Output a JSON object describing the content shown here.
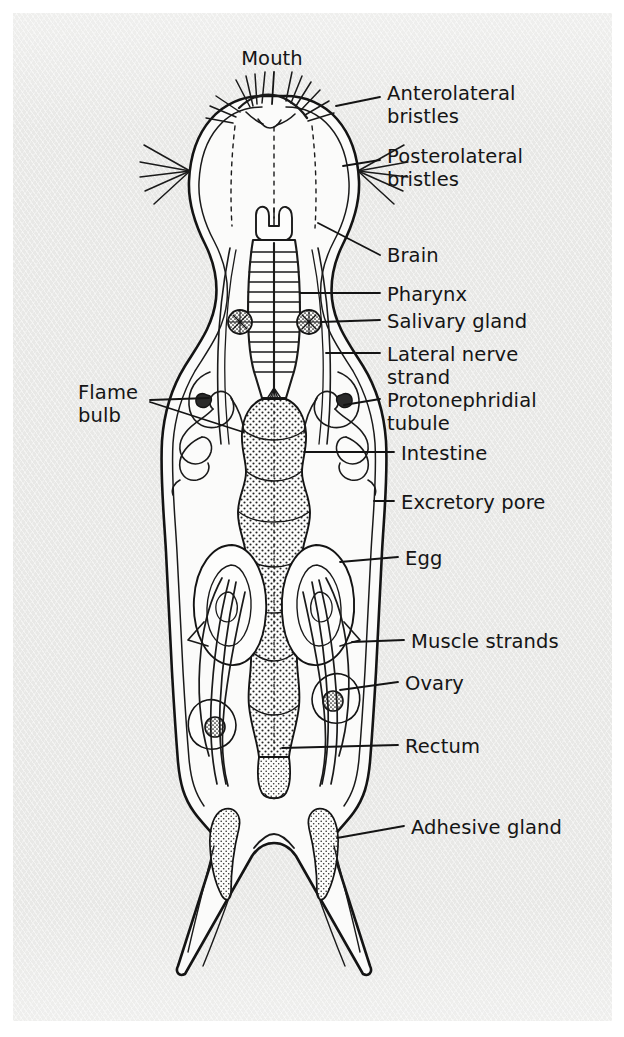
{
  "figure": {
    "organism_outline_color": "#1a1a1a",
    "body_fill_color": "#fbfbfa",
    "panel_background_color": "#e8e8e6",
    "label_text_color": "#151515",
    "stipple_color": "#2a2a2a"
  },
  "labels": [
    {
      "id": "mouth",
      "text": "Mouth",
      "side": "top",
      "x": 252,
      "y": 48
    },
    {
      "id": "anterolateral-bristles",
      "text": "Anterolateral\nbristles",
      "side": "right",
      "x": 387,
      "y": 83
    },
    {
      "id": "posterolateral-bristles",
      "text": "Posterolateral\nbristles",
      "side": "right",
      "x": 387,
      "y": 146
    },
    {
      "id": "brain",
      "text": "Brain",
      "side": "right",
      "x": 387,
      "y": 245
    },
    {
      "id": "pharynx",
      "text": "Pharynx",
      "side": "right",
      "x": 387,
      "y": 284
    },
    {
      "id": "salivary-gland",
      "text": "Salivary gland",
      "side": "right",
      "x": 387,
      "y": 311
    },
    {
      "id": "lateral-nerve-strand",
      "text": "Lateral nerve\nstrand",
      "side": "right",
      "x": 387,
      "y": 344
    },
    {
      "id": "protonephridial-tubule",
      "text": "Protonephridial\ntubule",
      "side": "right",
      "x": 387,
      "y": 390
    },
    {
      "id": "intestine",
      "text": "Intestine",
      "side": "right",
      "x": 401,
      "y": 443
    },
    {
      "id": "excretory-pore",
      "text": "Excretory pore",
      "side": "right",
      "x": 401,
      "y": 492
    },
    {
      "id": "egg",
      "text": "Egg",
      "side": "right",
      "x": 405,
      "y": 548
    },
    {
      "id": "muscle-strands",
      "text": "Muscle strands",
      "side": "right",
      "x": 411,
      "y": 631
    },
    {
      "id": "ovary",
      "text": "Ovary",
      "side": "right",
      "x": 405,
      "y": 673
    },
    {
      "id": "rectum",
      "text": "Rectum",
      "side": "right",
      "x": 405,
      "y": 736
    },
    {
      "id": "adhesive-gland",
      "text": "Adhesive gland",
      "side": "right",
      "x": 411,
      "y": 817
    },
    {
      "id": "flame-bulb",
      "text": "Flame\nbulb",
      "side": "left",
      "x": 78,
      "y": 382
    }
  ],
  "structures": [
    {
      "id": "head",
      "name": "Head with bristle tufts"
    },
    {
      "id": "pharynx-barrel",
      "name": "Striated muscular pharynx"
    },
    {
      "id": "salivary-glands",
      "name": "Paired salivary glands"
    },
    {
      "id": "intestine-column",
      "name": "Stippled lobed intestine"
    },
    {
      "id": "protonephridia",
      "name": "Coiled protonephridial tubules with flame bulbs"
    },
    {
      "id": "eggs",
      "name": "Paired ovoid eggs"
    },
    {
      "id": "ovaries",
      "name": "Paired ovaries"
    },
    {
      "id": "muscle-strands",
      "name": "Longitudinal muscle strands"
    },
    {
      "id": "rectum",
      "name": "Terminal rectum"
    },
    {
      "id": "adhesive-glands",
      "name": "Stippled adhesive glands in caudal toes"
    },
    {
      "id": "toes",
      "name": "Paired forked caudal toes"
    }
  ]
}
